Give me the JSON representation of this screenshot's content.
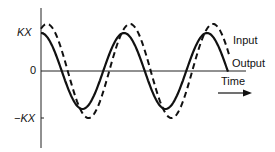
{
  "diagram": {
    "title": "",
    "y_labels": {
      "top": "KX",
      "zero": "0",
      "bottom": "−KX"
    },
    "legend": {
      "input": "Input",
      "output": "Output"
    },
    "x_label": "Time",
    "series": [
      {
        "name": "Input",
        "style": "dashed",
        "amplitude": 1.2,
        "phase_lag": 0
      },
      {
        "name": "Output",
        "style": "solid",
        "amplitude": 1.0,
        "phase_lag": "leads input slightly"
      }
    ],
    "colors": {
      "line": "#111111",
      "background": "#ffffff"
    }
  }
}
